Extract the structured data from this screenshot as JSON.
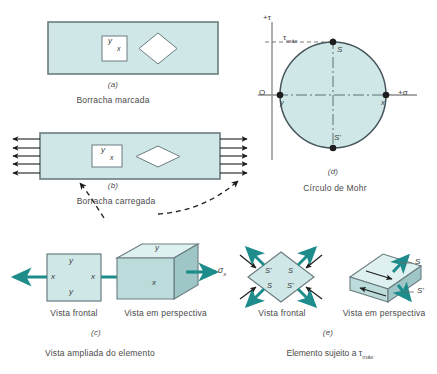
{
  "figure": {
    "title_alt": "Mohr circle rubber element figure",
    "fill_light": "#cfe7e7",
    "fill_mid": "#bcdcdc",
    "fill_dark": "#a9cfd0",
    "fill_face_top": "#dff0f0",
    "fill_face_side": "#9fc6c7",
    "stroke": "#6b7c80",
    "teal": "#1f8c8c",
    "ink": "#2b2b2b",
    "text": "#4a4a4a"
  },
  "panel_a": {
    "letter": "(a)",
    "caption": "Borracha marcada",
    "square_label_y": "y",
    "square_label_x": "x"
  },
  "panel_b": {
    "letter": "(b)",
    "caption": "Borracha carregada",
    "square_label_y": "y",
    "square_label_x": "x",
    "arrows_per_side": 5
  },
  "panel_c": {
    "letter": "(c)",
    "caption": "Vista ampliada do elemento",
    "front_view_label": "Vista frontal",
    "perspective_view_label": "Vista em perspectiva",
    "front_labels": {
      "top_y": "y",
      "left_x": "x",
      "right_x": "x",
      "bottom_y": "y"
    },
    "persp_labels": {
      "top_y": "y",
      "front_x": "x",
      "sigma": "σ",
      "sigma_sub": "x"
    }
  },
  "panel_d": {
    "letter": "(d)",
    "caption": "Círculo de Mohr",
    "axis_tau": "+τ",
    "axis_sigma": "+σ",
    "tau_max": "τ",
    "tau_max_sub": "máx",
    "origin": "O",
    "point_y": "y",
    "point_x": "x",
    "point_s_top": "S",
    "point_s_bottom": "S'"
  },
  "panel_e": {
    "letter": "(e)",
    "caption": "Elemento sujeito a τ",
    "caption_sub": "máx",
    "front_view_label": "Vista frontal",
    "perspective_view_label": "Vista em perspectiva",
    "diamond_labels": {
      "tl": "S'",
      "tr": "S",
      "bl": "S",
      "br": "S'"
    },
    "persp_labels": {
      "upper": "S",
      "lower": "S'"
    }
  }
}
